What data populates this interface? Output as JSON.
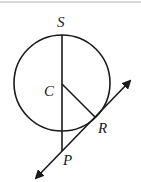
{
  "diagram": {
    "type": "geometry",
    "labels": {
      "S": "S",
      "C": "C",
      "R": "R",
      "P": "P"
    },
    "points": {
      "S": [
        62,
        34
      ],
      "C": [
        62,
        83
      ],
      "R": [
        95,
        117
      ],
      "P": [
        62,
        151
      ]
    },
    "circle": {
      "center": [
        62,
        83
      ],
      "radius": 48
    },
    "tangent_line": {
      "from": [
        33,
        181
      ],
      "to": [
        133,
        78
      ],
      "arrows": "both"
    },
    "stroke_color": "#1a1a1a"
  }
}
